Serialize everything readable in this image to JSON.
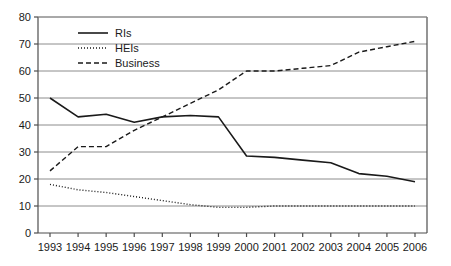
{
  "chart_data": {
    "type": "line",
    "title": "",
    "xlabel": "",
    "ylabel": "",
    "x": [
      "1993",
      "1994",
      "1995",
      "1996",
      "1997",
      "1998",
      "1999",
      "2000",
      "2001",
      "2002",
      "2003",
      "2004",
      "2005",
      "2006"
    ],
    "categories": [
      "1993",
      "1994",
      "1995",
      "1996",
      "1997",
      "1998",
      "1999",
      "2000",
      "2001",
      "2002",
      "2003",
      "2004",
      "2005",
      "2006"
    ],
    "ylim": [
      0,
      80
    ],
    "yticks": [
      0,
      10,
      20,
      30,
      40,
      50,
      60,
      70,
      80
    ],
    "ytick_labels": [
      "0",
      "10",
      "20",
      "30",
      "40",
      "50",
      "60",
      "70",
      "80"
    ],
    "grid": true,
    "grid_axis": "y",
    "legend_position": "top-left",
    "series": [
      {
        "name": "RIs",
        "style": "solid",
        "color": "#1a1a1a",
        "values": [
          50,
          43,
          44,
          41,
          43,
          43.5,
          43,
          28.5,
          28,
          27,
          26,
          22,
          21,
          19
        ]
      },
      {
        "name": "HEIs",
        "style": "dotted",
        "color": "#1a1a1a",
        "values": [
          18,
          16,
          15,
          13.5,
          12,
          10.5,
          9.5,
          9.5,
          10,
          10,
          10,
          10,
          10,
          10
        ]
      },
      {
        "name": "Business",
        "style": "dashed",
        "color": "#1a1a1a",
        "values": [
          23,
          32,
          32,
          38,
          43,
          48,
          53,
          60,
          60,
          61,
          62,
          67,
          69,
          71
        ]
      }
    ]
  },
  "legend": {
    "items": [
      {
        "label": "RIs",
        "style": "solid"
      },
      {
        "label": "HEIs",
        "style": "dotted"
      },
      {
        "label": "Business",
        "style": "dashed"
      }
    ]
  },
  "axis": {
    "y_labels": [
      "80",
      "70",
      "60",
      "50",
      "40",
      "30",
      "20",
      "10",
      "0"
    ],
    "x_labels": [
      "1993",
      "1994",
      "1995",
      "1996",
      "1997",
      "1998",
      "1999",
      "2000",
      "2001",
      "2002",
      "2003",
      "2004",
      "2005",
      "2006"
    ]
  },
  "colors": {
    "line": "#1a1a1a",
    "grid": "#8c8c8c",
    "axis": "#4d4d4d",
    "background": "#ffffff"
  }
}
